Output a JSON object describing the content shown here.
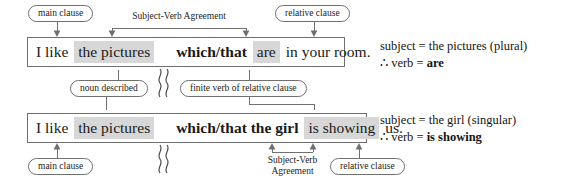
{
  "figure": {
    "line_color": "#70706f",
    "box_border_color": "#6f6f6f",
    "highlight_color": "#d7d7d7",
    "text_color": "#1a1a1a"
  },
  "example_1": {
    "sentence_parts": {
      "main_plain": "I like",
      "main_highlight": "the pictures",
      "rel_bold": "which/that",
      "rel_highlight": "are",
      "rel_tail": "in your room."
    },
    "labels": {
      "top_left_bubble": "main clause",
      "top_bracket": "Subject-Verb Agreement",
      "top_right_bubble": "relative clause",
      "bottom_left_bubble": "noun described",
      "bottom_right_bubble": "finite verb of relative clause"
    },
    "explanation": {
      "line1": "subject = the pictures (plural)",
      "line2_prefix": "∴ verb = ",
      "line2_bold": "are"
    }
  },
  "example_2": {
    "sentence_parts": {
      "main_plain": "I like",
      "main_highlight": "the pictures",
      "rel_bold": "which/that the girl",
      "rel_highlight": "is showing",
      "rel_tail": "us."
    },
    "labels": {
      "bottom_left_bubble": "main clause",
      "bottom_bracket_line1": "Subject-Verb",
      "bottom_bracket_line2": "Agreement",
      "bottom_right_bubble": "relative clause"
    },
    "explanation": {
      "line1": "subject = the girl (singular)",
      "line2_prefix": "∴ verb = ",
      "line2_bold": "is showing"
    }
  }
}
